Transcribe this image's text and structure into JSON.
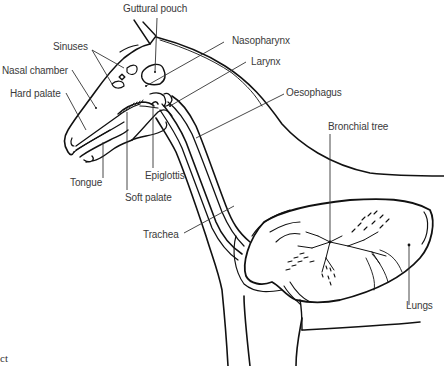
{
  "diagram": {
    "labels": {
      "guttural_pouch": "Guttural pouch",
      "sinuses": "Sinuses",
      "nasal_chamber": "Nasal chamber",
      "hard_palate": "Hard palate",
      "nasopharynx": "Nasopharynx",
      "larynx": "Larynx",
      "oesophagus": "Oesophagus",
      "bronchial_tree": "Bronchial tree",
      "tongue": "Tongue",
      "epiglottis": "Epiglottis",
      "soft_palate": "Soft palate",
      "trachea": "Trachea",
      "lungs": "Lungs"
    },
    "cropped_text": "ct",
    "colors": {
      "line": "#111111",
      "leader": "#333333",
      "text": "#3a3a3a",
      "background": "#ffffff"
    }
  }
}
